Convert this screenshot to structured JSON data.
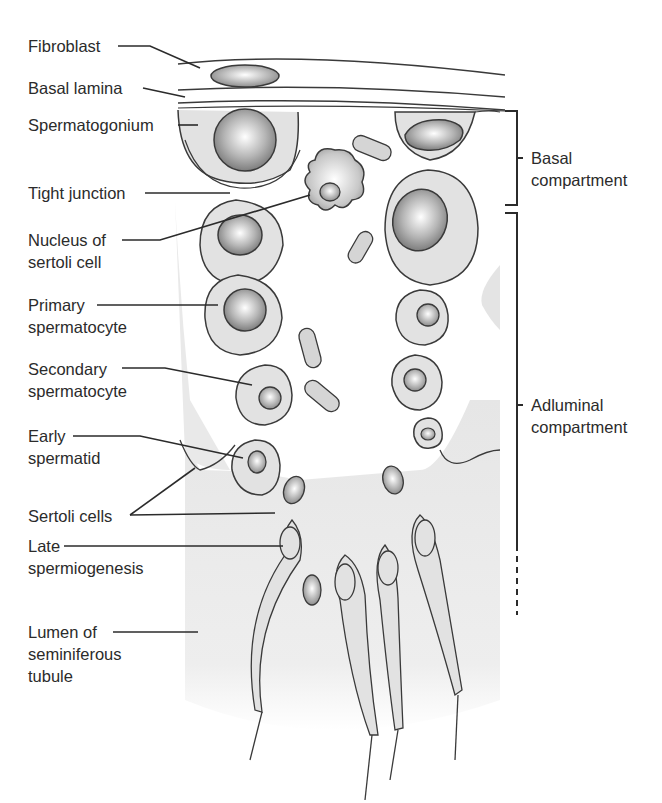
{
  "figure": {
    "type": "anatomical-diagram",
    "colors": {
      "outline": "#3a3a3a",
      "cytoplasm_fill": "#e4e4e4",
      "lumen_shade": "#ececec",
      "nucleus_dark": "#8a8a8a",
      "nucleus_light": "#ffffff",
      "background": "#ffffff"
    }
  },
  "left_labels": [
    {
      "id": "fibroblast",
      "lines": [
        "Fibroblast"
      ]
    },
    {
      "id": "basal-lamina",
      "lines": [
        "Basal lamina"
      ]
    },
    {
      "id": "spermatogonium",
      "lines": [
        "Spermatogonium"
      ]
    },
    {
      "id": "tight-junction",
      "lines": [
        "Tight junction"
      ]
    },
    {
      "id": "nucleus-of-sertoli-cell",
      "lines": [
        "Nucleus of",
        "sertoli cell"
      ]
    },
    {
      "id": "primary-spermatocyte",
      "lines": [
        "Primary",
        "spermatocyte"
      ]
    },
    {
      "id": "secondary-spermatocyte",
      "lines": [
        "Secondary",
        "spermatocyte"
      ]
    },
    {
      "id": "early-spermatid",
      "lines": [
        "Early",
        "spermatid"
      ]
    },
    {
      "id": "sertoli-cells",
      "lines": [
        "Sertoli cells"
      ]
    },
    {
      "id": "late-spermiogenesis",
      "lines": [
        "Late",
        "spermiogenesis"
      ]
    },
    {
      "id": "lumen",
      "lines": [
        "Lumen of",
        "seminiferous",
        "tubule"
      ]
    }
  ],
  "right_labels": [
    {
      "id": "basal-compartment",
      "lines": [
        "Basal",
        "compartment"
      ]
    },
    {
      "id": "adluminal-compartment",
      "lines": [
        "Adluminal",
        "compartment"
      ]
    }
  ]
}
